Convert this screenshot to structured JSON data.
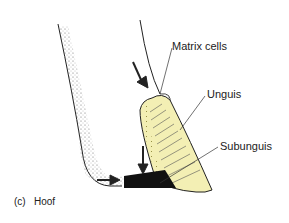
{
  "caption": {
    "letter": "(c)",
    "title": "Hoof"
  },
  "labels": {
    "matrix": "Matrix cells",
    "unguis": "Unguis",
    "subunguis": "Subunguis"
  },
  "colors": {
    "unguis_fill": "#f3efb4",
    "subunguis_fill": "#111111",
    "line": "#222222"
  }
}
